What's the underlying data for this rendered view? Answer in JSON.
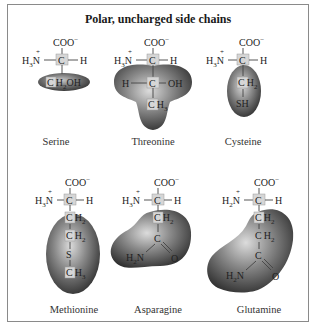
{
  "title": "Polar, uncharged side chains",
  "common": {
    "carboxylate": "COO",
    "carboxylate_charge": "−",
    "amino": "H",
    "amino_sub": "3",
    "amino_n": "N",
    "amino_charge": "+",
    "alpha_carbon": "C",
    "alpha_h": "H"
  },
  "amino_acids": [
    {
      "name": "Serine",
      "side_chain": [
        "CH2OH"
      ],
      "blob_shape": "flat-ellipse"
    },
    {
      "name": "Threonine",
      "side_chain": [
        "H—C—OH",
        "CH3"
      ],
      "blob_shape": "trefoil"
    },
    {
      "name": "Cysteine",
      "side_chain": [
        "CH2",
        "SH"
      ],
      "blob_shape": "ellipse"
    },
    {
      "name": "Methionine",
      "side_chain": [
        "CH2",
        "CH2",
        "S",
        "CH3"
      ],
      "blob_shape": "large-ellipse"
    },
    {
      "name": "Asparagine",
      "side_chain": [
        "CH2",
        "C",
        "H2N",
        "O"
      ],
      "blob_shape": "kidney"
    },
    {
      "name": "Glutamine",
      "side_chain": [
        "CH2",
        "CH2",
        "C",
        "H2N",
        "O"
      ],
      "blob_shape": "heart"
    }
  ],
  "labels": {
    "serine": "Serine",
    "threonine": "Threonine",
    "cysteine": "Cysteine",
    "methionine": "Methionine",
    "asparagine": "Asparagine",
    "glutamine": "Glutamine"
  },
  "atoms": {
    "C": "C",
    "H": "H",
    "O": "O",
    "N": "N",
    "S": "S",
    "CH2_C": "C",
    "CH2_H": "H",
    "sub2": "2",
    "sub3": "3",
    "OH": "OH",
    "SH": "SH",
    "CH2OH_rest": "OH"
  },
  "colors": {
    "frame": "#8a8a8a",
    "blob_dark": "#3a3a3a",
    "blob_light": "#d8d8d8",
    "carbon_box": "#d6d6d6"
  }
}
